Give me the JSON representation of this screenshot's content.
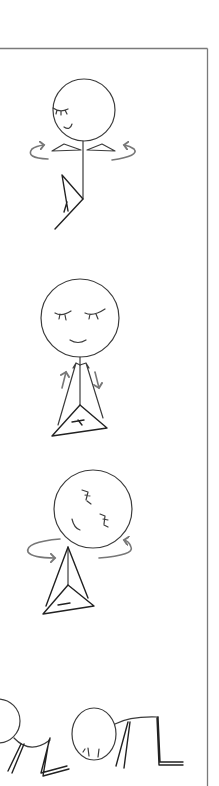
{
  "illustration": {
    "description": "Line-drawn stick figures demonstrating gentle exercise movements inside a panel frame",
    "colors": {
      "background": "#ffffff",
      "frame": "#7a7a7a",
      "ink": "#3c3c3c",
      "arrow": "#777777"
    },
    "figures": [
      {
        "id": "figure-1",
        "label": "Standing twist with arms out, one leg bent",
        "motion": "rotating arrows around shoulders"
      },
      {
        "id": "figure-2",
        "label": "Standing with closed eyes and smile, arms sliding up and down",
        "motion": "up and down arrows beside arms"
      },
      {
        "id": "figure-3",
        "label": "Tilted head, seated cross-legged twist",
        "motion": "rotating arrows around shoulders"
      },
      {
        "id": "figure-4",
        "label": "Kneeling forward fold, head down on ground",
        "motion": "none"
      }
    ]
  }
}
